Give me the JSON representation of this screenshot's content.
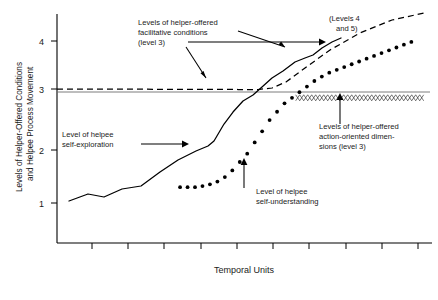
{
  "figure": {
    "title": "",
    "background": "#ffffff",
    "ink_color": "#000000"
  },
  "axes": {
    "y_axis_title_line1": "Levels of Helper-Offered Conditions",
    "y_axis_title_line2": "and Helpee Process Movement",
    "x_axis_title": "Temporal Units",
    "y_ticks": [
      "1",
      "2",
      "3",
      "4"
    ],
    "x_tick_count": 10
  },
  "annotations": {
    "facilitative": {
      "line1": "Levels of helper-offered",
      "line2": "facilitative conditions",
      "line3": "(level 3)"
    },
    "levels_4_5": {
      "line1": "(Levels 4",
      "line2": "and 5)"
    },
    "self_exploration": {
      "line1": "Level of helpee",
      "line2": "self-exploration"
    },
    "action_oriented": {
      "line1": "Levels of helper-offered",
      "line2": "action-oriented dimen-",
      "line3": "sions (level 3)"
    },
    "self_understanding": {
      "line1": "Level of helpee",
      "line2": "self-understanding"
    }
  },
  "chart_data": {
    "type": "line",
    "title": "",
    "xlabel": "Temporal Units",
    "ylabel": "Levels of Helper-Offered Conditions and Helpee Process Movement",
    "xlim": [
      0,
      10
    ],
    "ylim": [
      0.4,
      4.5
    ],
    "ytick_values": [
      1,
      2,
      3,
      4
    ],
    "xtick_values": [
      1,
      2,
      3,
      4,
      5,
      6,
      7,
      8,
      9,
      10
    ],
    "grid": false,
    "legend": "none (inline annotations with leader arrows)",
    "series": [
      {
        "name": "Level of helpee self-exploration",
        "style": "solid",
        "x": [
          0.55,
          1.05,
          1.55,
          2.05,
          2.55,
          3.05,
          3.55,
          4.1,
          4.6,
          5.1,
          5.6,
          6.1,
          6.6,
          7.1,
          7.6,
          8.1
        ],
        "values": [
          1.05,
          1.2,
          1.15,
          1.3,
          1.35,
          1.65,
          1.9,
          2.05,
          2.6,
          2.85,
          2.95,
          3.0,
          3.05,
          3.1,
          3.15,
          3.2
        ]
      },
      {
        "name": "Level of helpee self-understanding",
        "style": "dotted",
        "x": [
          3.3,
          3.5,
          3.7,
          3.9,
          4.1,
          4.3,
          4.5,
          4.7,
          4.9,
          5.1,
          5.3,
          5.5,
          5.7,
          5.9,
          6.1,
          6.3,
          6.5,
          6.7,
          6.9,
          7.1,
          7.3,
          7.5,
          7.7,
          7.9,
          8.1,
          8.3,
          8.5,
          8.7,
          8.9,
          9.1,
          9.3,
          9.5
        ],
        "values": [
          1.4,
          1.4,
          1.4,
          1.42,
          1.45,
          1.5,
          1.58,
          1.7,
          1.85,
          2.0,
          2.2,
          2.4,
          2.6,
          2.75,
          2.9,
          3.0,
          3.1,
          3.2,
          3.3,
          3.38,
          3.45,
          3.5,
          3.55,
          3.6,
          3.65,
          3.7,
          3.75,
          3.8,
          3.85,
          3.9,
          3.95,
          4.0
        ]
      },
      {
        "name": "Levels of helper-offered facilitative conditions (level 3)",
        "style": "dashed",
        "x": [
          0.3,
          5.0,
          6.0,
          6.5,
          7.0,
          8.0,
          9.0,
          9.9
        ],
        "values": [
          3.02,
          3.0,
          3.0,
          3.1,
          3.3,
          3.7,
          4.1,
          4.45
        ]
      },
      {
        "name": "Levels of helper-offered action-oriented dimensions (level 3)",
        "style": "xxx-hatched",
        "x": [
          6.4,
          9.9
        ],
        "values": [
          3.0,
          3.0
        ]
      },
      {
        "name": "Level 3 reference line",
        "style": "thin-solid-gray",
        "x": [
          0.3,
          9.9
        ],
        "values": [
          3.0,
          3.0
        ]
      }
    ]
  }
}
